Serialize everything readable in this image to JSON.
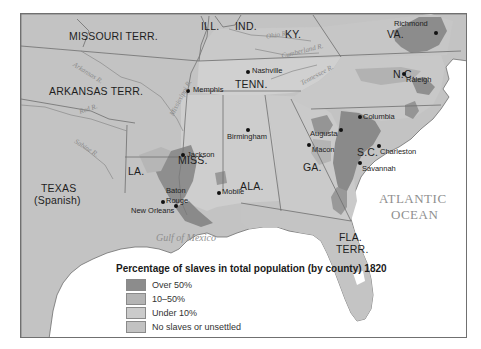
{
  "map": {
    "title": "Percentage of slaves in total population (by county) 1820",
    "colors": {
      "over_50": "#8c8c8c",
      "ten_to_50": "#b4b4b4",
      "under_10": "#cbcbcb",
      "no_slaves": "#c2c2c2",
      "water": "#ffffff",
      "border": "#6e6e6e",
      "river": "#8a8a8a"
    },
    "states": {
      "missouri": "MISSOURI  TERR.",
      "illinois": "ILL.",
      "indiana": "IND.",
      "kentucky": "KY.",
      "virginia": "VA.",
      "arkansas": "ARKANSAS  TERR.",
      "tennessee": "TENN.",
      "north_carolina": "N.C.",
      "mississippi": "MISS.",
      "alabama": "ALA.",
      "georgia": "GA.",
      "south_carolina": "S.C.",
      "louisiana": "LA.",
      "texas_line1": "TEXAS",
      "texas_line2": "(Spanish)",
      "florida_line1": "FLA.",
      "florida_line2": "TERR."
    },
    "cities": {
      "richmond": "Richmond",
      "nashville": "Nashville",
      "memphis": "Memphis",
      "raleigh": "Raleigh",
      "columbia": "Columbia",
      "augusta": "Augusta",
      "birmingham": "Birmingham",
      "jackson": "Jackson",
      "macon": "Macon",
      "charleston": "Charleston",
      "savannah": "Savannah",
      "baton_rouge_line1": "Baton",
      "baton_rouge_line2": "Rouge",
      "mobile": "Mobile",
      "new_orleans": "New Orleans"
    },
    "rivers": {
      "ohio": "Ohio R.",
      "cumberland": "Cumberland R.",
      "tennessee": "Tennessee R.",
      "mississippi": "Mississippi R.",
      "arkansas": "Arkansas R.",
      "red": "Red R.",
      "sabine": "Sabine R."
    },
    "water_bodies": {
      "gulf": "Gulf of Mexico",
      "atlantic_line1": "ATLANTIC",
      "atlantic_line2": "OCEAN"
    }
  },
  "legend": {
    "title": "Percentage of slaves in total population (by county) 1820",
    "items": [
      {
        "label": "Over 50%",
        "color": "#8c8c8c"
      },
      {
        "label": "10–50%",
        "color": "#b4b4b4"
      },
      {
        "label": "Under 10%",
        "color": "#cbcbcb"
      },
      {
        "label": "No slaves or unsettled",
        "color": "#c2c2c2"
      }
    ]
  }
}
